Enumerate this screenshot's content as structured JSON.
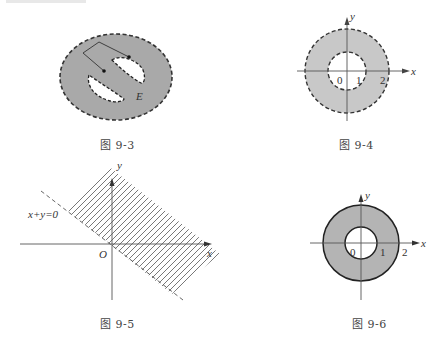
{
  "figures": [
    {
      "id": "fig-9-3",
      "caption": "图 9-3",
      "description": "Open region E (shaded ellipse with dashed boundary) containing two white holes; a polyline path connects two points inside E",
      "labels": {
        "region": "E"
      },
      "colors": {
        "fill": "#a9a9a9",
        "boundary": "#333333",
        "hole": "#ffffff"
      }
    },
    {
      "id": "fig-9-4",
      "caption": "图 9-4",
      "description": "Open annulus 1 < x^2+y^2 < 4 with dashed boundaries",
      "labels": {
        "x_axis": "x",
        "y_axis": "y",
        "origin": "0",
        "tick_1": "1",
        "tick_2": "2"
      },
      "colors": {
        "fill": "#c8c8c8",
        "boundary": "#333333"
      }
    },
    {
      "id": "fig-9-5",
      "caption": "图 9-5",
      "description": "Half-plane x+y>0 shown with hatching, bounded by dashed line x+y=0",
      "labels": {
        "x_axis": "x",
        "y_axis": "y",
        "origin": "O",
        "line": "x+y=0"
      },
      "colors": {
        "hatch": "#555555",
        "boundary": "#555555"
      }
    },
    {
      "id": "fig-9-6",
      "caption": "图 9-6",
      "description": "Closed annulus 1 ≤ x^2+y^2 ≤ 4 with solid boundaries",
      "labels": {
        "x_axis": "x",
        "y_axis": "y",
        "origin": "0",
        "tick_1": "1",
        "tick_2": "2"
      },
      "colors": {
        "fill": "#b4b4b4",
        "boundary": "#222222"
      }
    }
  ]
}
